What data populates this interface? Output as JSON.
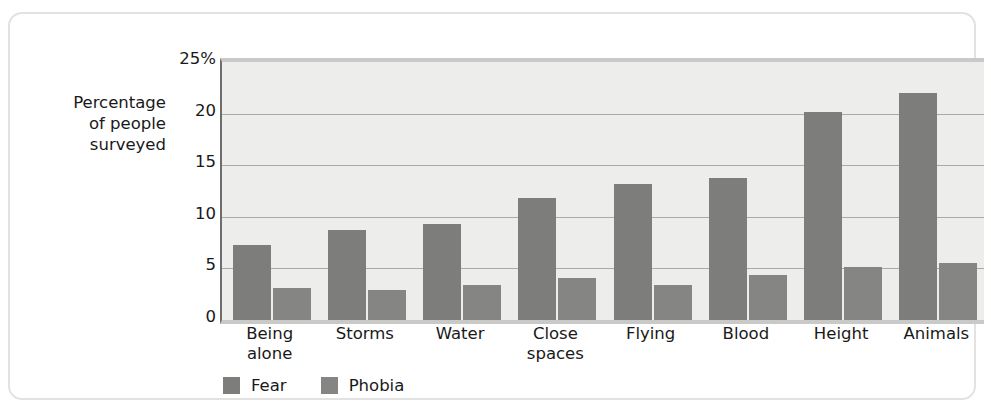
{
  "chart_data": {
    "type": "bar",
    "title": "",
    "subtitle": "",
    "xlabel": "",
    "ylabel": "Percentage\nof people\nsurveyed",
    "ylim": [
      0,
      25
    ],
    "grid": true,
    "legend_position": "bottom-left",
    "ytick_labels": [
      "25%",
      "20",
      "15",
      "10",
      "5",
      "0"
    ],
    "ytick_values": [
      25,
      20,
      15,
      10,
      5,
      0
    ],
    "categories": [
      "Being\nalone",
      "Storms",
      "Water",
      "Close\nspaces",
      "Flying",
      "Blood",
      "Height",
      "Animals"
    ],
    "series": [
      {
        "name": "Fear",
        "color": "#7d7d7c",
        "values": [
          7.3,
          8.7,
          9.3,
          11.8,
          13.2,
          13.8,
          20.2,
          22.0
        ]
      },
      {
        "name": "Phobia",
        "color": "#858584",
        "values": [
          3.1,
          2.9,
          3.4,
          4.1,
          3.4,
          4.4,
          5.1,
          5.5
        ]
      }
    ],
    "plot_background": "#ededec",
    "gridline_color": "#a9a9a7",
    "axis_color": "#6e6e6e",
    "frame_color": "#e2e2e2"
  }
}
